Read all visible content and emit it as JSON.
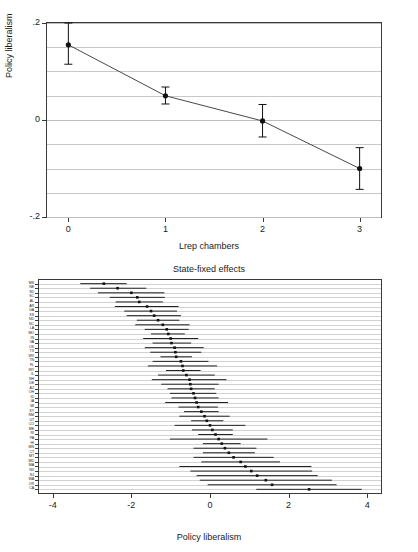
{
  "figure": {
    "background": "#ffffff",
    "marker_color": "#111111",
    "line_color": "#333333",
    "grid_color": "#c8c8c8",
    "axis_color": "#3a3a3a"
  },
  "chart_data": [
    {
      "type": "line",
      "id": "marginal-effects-plot",
      "title": "",
      "xlabel": "Lrep chambers",
      "ylabel": "Policy liberalism",
      "xlim": [
        -0.22,
        3.22
      ],
      "ylim": [
        -0.2,
        0.2
      ],
      "xticks": [
        0,
        1,
        2,
        3
      ],
      "xticklabels": [
        "0",
        "1",
        "2",
        "3"
      ],
      "yticks": [
        -0.2,
        0,
        0.2
      ],
      "yticklabels": [
        "-.2",
        "0",
        ".2"
      ],
      "grid": true,
      "gridlines_y": [
        -0.15,
        -0.1,
        -0.05,
        0.05,
        0.1,
        0.15
      ],
      "error_bars": true,
      "x": [
        0,
        1,
        2,
        3
      ],
      "values": [
        0.155,
        0.05,
        -0.002,
        -0.1
      ],
      "ci_low": [
        0.115,
        0.033,
        -0.035,
        -0.143
      ],
      "ci_high": [
        0.2,
        0.068,
        0.032,
        -0.057
      ]
    },
    {
      "type": "scatter",
      "id": "state-fixed-effects-plot",
      "title": "State-fixed effects",
      "xlabel": "Policy liberalism",
      "ylabel": "",
      "xlim": [
        -4.35,
        4.35
      ],
      "xticks": [
        -4,
        -2,
        0,
        2,
        4
      ],
      "xticklabels": [
        "-4",
        "-2",
        "0",
        "2",
        "4"
      ],
      "grid": true,
      "error_bars": true,
      "orientation": "horizontal",
      "categories": [
        "MS",
        "NE",
        "SD",
        "SC",
        "AL",
        "AR",
        "GA",
        "KS",
        "ND",
        "NC",
        "LA",
        "MO",
        "IN",
        "VA",
        "OK",
        "TX",
        "WV",
        "TN",
        "FL",
        "WY",
        "IL",
        "NH",
        "DE",
        "AZ",
        "OH",
        "ID",
        "IA",
        "MI",
        "KY",
        "NM",
        "UT",
        "CO",
        "ME",
        "RI",
        "PA",
        "HI",
        "MN",
        "CT",
        "MT",
        "MD",
        "MA",
        "NV",
        "NJ",
        "WA",
        "OR",
        "CA"
      ],
      "values": [
        -2.7,
        -2.35,
        -2.0,
        -1.85,
        -1.8,
        -1.6,
        -1.5,
        -1.42,
        -1.32,
        -1.2,
        -1.1,
        -1.06,
        -1.0,
        -0.98,
        -0.9,
        -0.88,
        -0.86,
        -0.74,
        -0.7,
        -0.68,
        -0.6,
        -0.52,
        -0.5,
        -0.48,
        -0.42,
        -0.38,
        -0.34,
        -0.3,
        -0.22,
        -0.14,
        -0.08,
        0.0,
        0.06,
        0.14,
        0.22,
        0.3,
        0.38,
        0.48,
        0.6,
        0.78,
        0.9,
        1.05,
        1.2,
        1.42,
        1.58,
        2.52
      ],
      "ci_low": [
        -3.3,
        -3.05,
        -2.85,
        -2.55,
        -2.4,
        -2.42,
        -2.18,
        -2.12,
        -1.86,
        -1.9,
        -1.66,
        -1.5,
        -1.7,
        -1.46,
        -1.66,
        -1.52,
        -1.26,
        -1.46,
        -1.58,
        -1.12,
        -1.32,
        -1.48,
        -1.24,
        -1.08,
        -1.02,
        -0.98,
        -1.14,
        -0.8,
        -0.66,
        -0.78,
        -0.48,
        -0.9,
        -0.46,
        -0.3,
        -1.02,
        -0.18,
        -0.42,
        -0.18,
        -0.42,
        -0.22,
        -0.78,
        -0.5,
        -0.34,
        -0.26,
        -0.06,
        1.18
      ],
      "ci_high": [
        -2.12,
        -1.62,
        -1.16,
        -1.15,
        -1.2,
        -0.8,
        -0.84,
        -0.74,
        -0.78,
        -0.52,
        -0.54,
        -0.64,
        -0.3,
        -0.48,
        -0.16,
        -0.22,
        -0.46,
        -0.04,
        0.18,
        -0.24,
        0.12,
        0.42,
        0.22,
        0.12,
        0.16,
        0.22,
        0.46,
        0.2,
        0.22,
        0.5,
        0.34,
        0.9,
        0.58,
        0.58,
        1.46,
        0.78,
        1.18,
        1.14,
        1.62,
        1.78,
        2.58,
        2.6,
        2.74,
        3.1,
        3.22,
        3.86
      ]
    }
  ],
  "top_panel": {
    "ylabel": "Policy liberalism",
    "xlabel": "Lrep chambers",
    "yticklabels": [
      "-.2",
      "0",
      ".2"
    ],
    "xticklabels": [
      "0",
      "1",
      "2",
      "3"
    ]
  },
  "bottom_panel": {
    "title": "State-fixed effects",
    "xlabel": "Policy liberalism",
    "xticklabels": [
      "-4",
      "-2",
      "0",
      "2",
      "4"
    ]
  }
}
